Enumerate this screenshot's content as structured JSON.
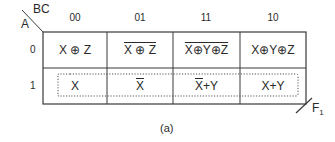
{
  "kmap": {
    "row_var": "A",
    "col_var": "BC",
    "column_headers": [
      "00",
      "01",
      "11",
      "10"
    ],
    "row_headers": [
      "0",
      "1"
    ],
    "cells": [
      [
        "X ⊕ Z",
        "X ⊕ Z",
        "X⊕Y⊕Z",
        "X⊕Y⊕Z"
      ],
      [
        "X",
        "X",
        "X+Y",
        "X+Y"
      ]
    ],
    "cell_overlines": [
      [
        "none",
        "full",
        "full",
        "none"
      ],
      [
        "none",
        "full",
        "first",
        "none"
      ]
    ],
    "loop": "row-1-all-columns (dotted)",
    "output_label": "F",
    "output_subscript": "1",
    "caption": "(a)",
    "line_color": "#3a3a3a",
    "loop_color": "#555555"
  }
}
